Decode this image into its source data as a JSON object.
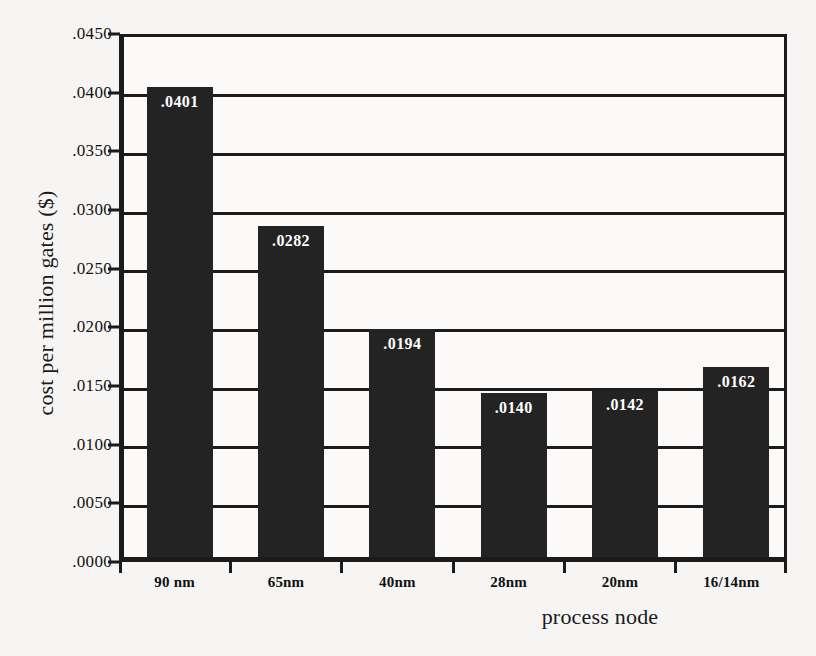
{
  "chart_data": {
    "type": "bar",
    "title": "",
    "xlabel": "process node",
    "ylabel": "cost per million gates ($)",
    "categories": [
      "90 nm",
      "65nm",
      "40nm",
      "28nm",
      "20nm",
      "16/14nm"
    ],
    "values": [
      0.0401,
      0.0282,
      0.0194,
      0.014,
      0.0142,
      0.0162
    ],
    "data_labels": [
      ".0401",
      ".0282",
      ".0194",
      ".0140",
      ".0142",
      ".0162"
    ],
    "ylim": [
      0.0,
      0.045
    ],
    "ytick_values": [
      0.0,
      0.005,
      0.01,
      0.015,
      0.02,
      0.025,
      0.03,
      0.035,
      0.04,
      0.045
    ],
    "ytick_labels": [
      ".0000",
      ".0050",
      ".0100",
      ".0150",
      ".0200",
      ".0250",
      ".0300",
      ".0350",
      ".0400",
      ".0450"
    ],
    "grid": true,
    "legend": false,
    "legend_position": "none",
    "bar_color": "#232323",
    "axis_color": "#1b1b1b",
    "plot_background": "#fbfaf8",
    "page_background": "#f6f5f3",
    "data_label_color": "#ffffff"
  }
}
